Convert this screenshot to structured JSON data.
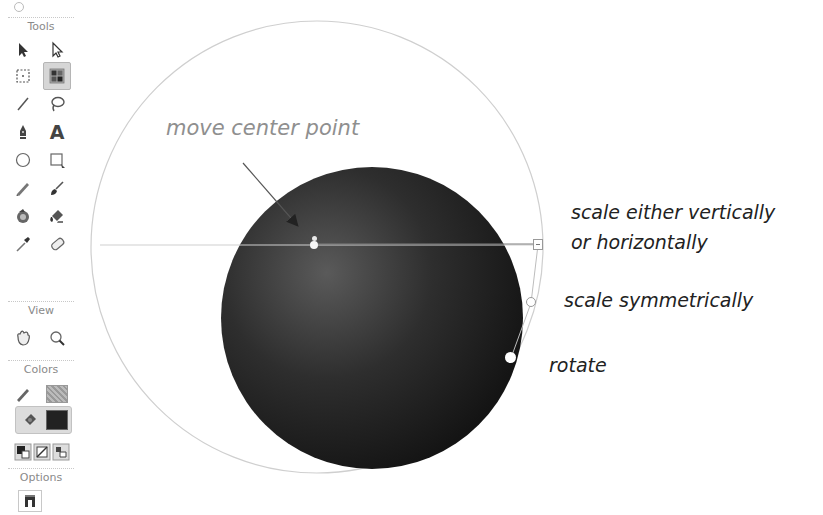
{
  "toolbar": {
    "sections": {
      "tools": "Tools",
      "view": "View",
      "colors": "Colors",
      "options": "Options"
    },
    "tools": [
      {
        "name": "selection-tool",
        "icon": "black-arrow-icon"
      },
      {
        "name": "subselection-tool",
        "icon": "white-arrow-icon"
      },
      {
        "name": "free-transform-tool",
        "icon": "free-transform-icon"
      },
      {
        "name": "gradient-transform-tool",
        "icon": "gradient-transform-icon",
        "selected": true
      },
      {
        "name": "line-tool",
        "icon": "line-icon"
      },
      {
        "name": "lasso-tool",
        "icon": "lasso-icon"
      },
      {
        "name": "pen-tool",
        "icon": "pen-icon"
      },
      {
        "name": "text-tool",
        "icon": "text-icon",
        "glyph": "A"
      },
      {
        "name": "oval-tool",
        "icon": "oval-icon"
      },
      {
        "name": "rectangle-tool",
        "icon": "rectangle-icon"
      },
      {
        "name": "pencil-tool",
        "icon": "pencil-icon"
      },
      {
        "name": "brush-tool",
        "icon": "brush-icon"
      },
      {
        "name": "ink-bottle-tool",
        "icon": "ink-bottle-icon"
      },
      {
        "name": "paint-bucket-tool",
        "icon": "paint-bucket-icon"
      },
      {
        "name": "eyedropper-tool",
        "icon": "eyedropper-icon"
      },
      {
        "name": "eraser-tool",
        "icon": "eraser-icon"
      }
    ],
    "view_tools": [
      {
        "name": "hand-tool",
        "icon": "hand-icon"
      },
      {
        "name": "zoom-tool",
        "icon": "magnifier-icon"
      }
    ],
    "colors": {
      "stroke_color": "#9a9a9a",
      "fill_color": "#222222"
    }
  },
  "canvas": {
    "annotations": {
      "center_point": "move center point",
      "scale_one_axis_line1": "scale either vertically",
      "scale_one_axis_line2": "or horizontally",
      "scale_symmetric": "scale symmetrically",
      "rotate": "rotate"
    },
    "gradient_fill": {
      "light": "#5a5a5a",
      "dark": "#141414"
    }
  }
}
